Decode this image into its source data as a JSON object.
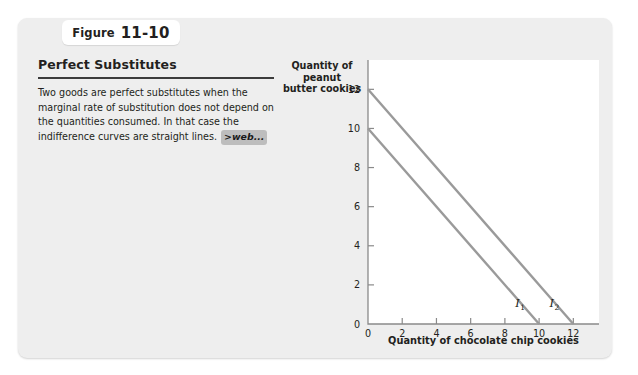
{
  "figure": {
    "label_word": "Figure",
    "number": "11-10"
  },
  "panel": {
    "title": "Perfect Substitutes",
    "body_text": "Two goods are perfect substitutes when the marginal rate of substitution does not depend on the quantities consumed. In that case the indifference curves are straight lines.",
    "web_badge": ">web..."
  },
  "colors": {
    "card_background": "#eeeeee",
    "page_background": "#ffffff",
    "plot_background": "#ffffff",
    "curve_color": "#9a9a9a",
    "axis_color": "#8a8a8a",
    "text_color": "#231f20",
    "rule_color": "#3b3b3b",
    "badge_background": "#bdbdbd"
  },
  "chart_data": {
    "type": "line",
    "title": "Perfect Substitutes",
    "xlabel": "Quantity of chocolate chip cookies",
    "ylabel": "Quantity of peanut butter cookies",
    "ylabel_lines": [
      "Quantity of",
      "peanut",
      "butter cookies"
    ],
    "xlim": [
      0,
      13.5
    ],
    "ylim": [
      0,
      13.5
    ],
    "xticks": [
      0,
      2,
      4,
      6,
      8,
      10,
      12
    ],
    "yticks": [
      0,
      2,
      4,
      6,
      8,
      10,
      12
    ],
    "xticklabels": [
      "0",
      "2",
      "4",
      "6",
      "8",
      "10",
      "12"
    ],
    "yticklabels": [
      "0",
      "2",
      "4",
      "6",
      "8",
      "10",
      "12"
    ],
    "grid": false,
    "legend": "none",
    "series": [
      {
        "name": "I1",
        "label": "I",
        "subscript": "1",
        "x": [
          0,
          10
        ],
        "y": [
          10,
          0
        ],
        "slope": -1,
        "x_intercept": 10,
        "y_intercept": 10
      },
      {
        "name": "I2",
        "label": "I",
        "subscript": "2",
        "x": [
          0,
          12
        ],
        "y": [
          12,
          0
        ],
        "slope": -1,
        "x_intercept": 12,
        "y_intercept": 12
      }
    ],
    "annotations": [
      {
        "text": "I1",
        "x": 8.6,
        "y": 0.85
      },
      {
        "text": "I2",
        "x": 10.6,
        "y": 0.85
      }
    ]
  }
}
